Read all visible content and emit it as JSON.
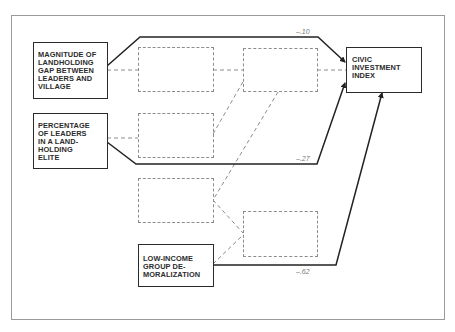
{
  "diagram": {
    "type": "path-diagram",
    "nodes": {
      "landholding_gap": {
        "label": "MAGNITUDE OF\nLANDHOLDING\nGAP BETWEEN\nLEADERS AND\nVILLAGE"
      },
      "landholding_elite": {
        "label": "PERCENTAGE\nOF LEADERS\nIN A LAND-\nHOLDING\nELITE"
      },
      "low_income": {
        "label": "LOW-INCOME\nGROUP DE-\nMORALIZATION"
      },
      "civic_index": {
        "label": "CIVIC\nINVESTMENT\nINDEX"
      }
    },
    "unlabeled_dashed_boxes": 5,
    "paths": [
      {
        "from": "landholding_gap",
        "to": "civic_index",
        "coefficient": "–.10",
        "style": "solid"
      },
      {
        "from": "landholding_elite",
        "to": "civic_index",
        "coefficient": "–.27",
        "style": "solid"
      },
      {
        "from": "low_income",
        "to": "civic_index",
        "coefficient": "–.62",
        "style": "solid"
      }
    ],
    "colors": {
      "solid_line": "#222222",
      "dashed_line": "#8c8c8c",
      "frame": "#9a9a9a",
      "text": "#2b2b2b",
      "coefficient_text": "#777777"
    }
  }
}
